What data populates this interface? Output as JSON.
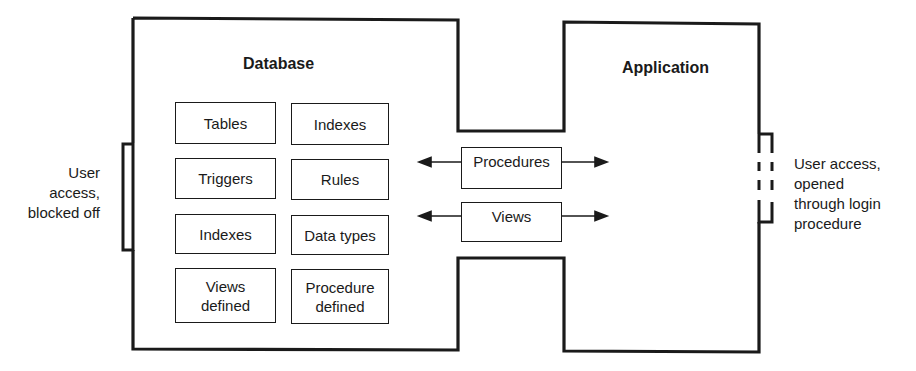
{
  "diagram": {
    "database": {
      "title": "Database",
      "components": [
        {
          "label": "Tables"
        },
        {
          "label": "Indexes"
        },
        {
          "label": "Triggers"
        },
        {
          "label": "Rules"
        },
        {
          "label": "Indexes"
        },
        {
          "label": "Data types"
        },
        {
          "label": "Views\ndefined"
        },
        {
          "label": "Procedure\ndefined"
        }
      ]
    },
    "application": {
      "title": "Application"
    },
    "interfaces": [
      {
        "label": "Procedures"
      },
      {
        "label": "Views"
      }
    ],
    "left_annotation": "User\naccess,\nblocked off",
    "right_annotation": "User access,\nopened\nthrough login\nprocedure",
    "colors": {
      "stroke": "#1a1a1a",
      "background": "#ffffff"
    }
  }
}
